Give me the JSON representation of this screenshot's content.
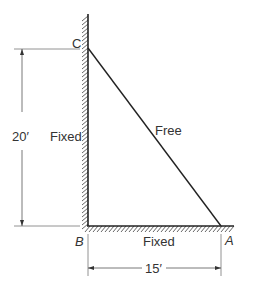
{
  "diagram": {
    "type": "triangular structure with fixed supports",
    "points": {
      "C": {
        "label": "C"
      },
      "B": {
        "label": "B"
      },
      "A": {
        "label": "A"
      }
    },
    "edges": [
      {
        "from": "B",
        "to": "C",
        "label": "Fixed"
      },
      {
        "from": "C",
        "to": "A",
        "label": "Free"
      },
      {
        "from": "B",
        "to": "A",
        "label": "Fixed"
      }
    ],
    "dimensions": {
      "vertical": "20′",
      "horizontal": "15′"
    }
  }
}
